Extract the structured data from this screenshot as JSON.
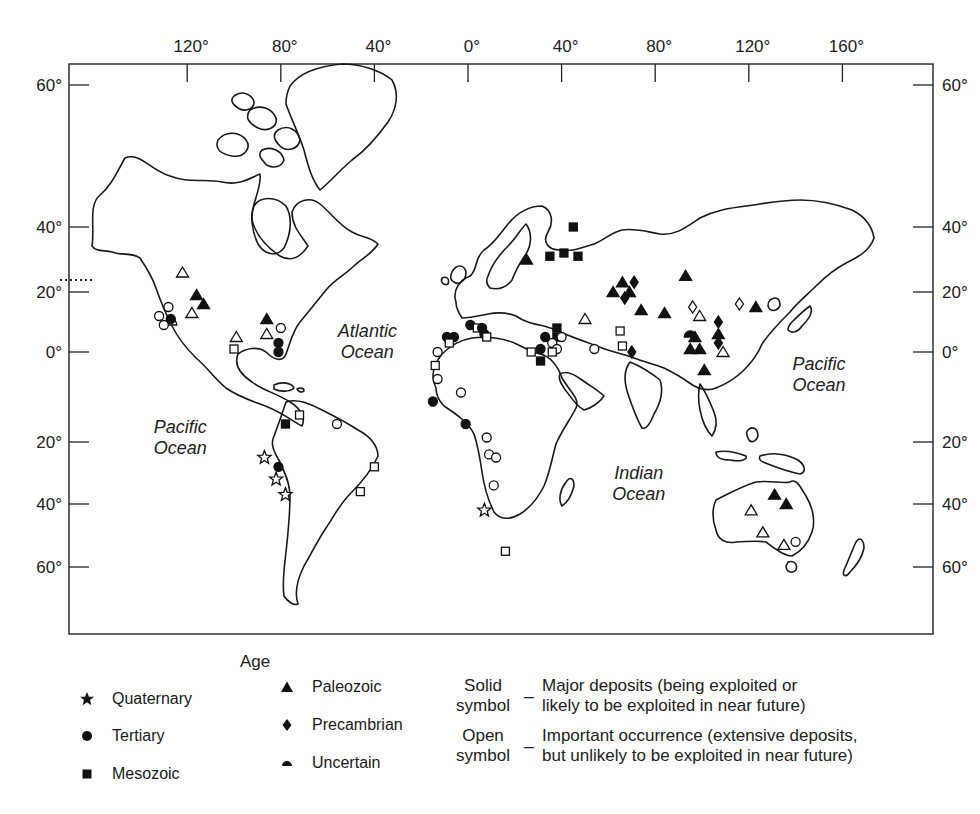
{
  "map": {
    "top_axis_labels": [
      "120°",
      "80°",
      "40°",
      "0°",
      "40°",
      "80°",
      "120°",
      "160°"
    ],
    "top_axis_longitudes": [
      -120,
      -80,
      -40,
      0,
      40,
      80,
      120,
      160
    ],
    "left_axis_labels": [
      "60°",
      "40°",
      "20°",
      "0°",
      "20°",
      "40°",
      "60°"
    ],
    "right_axis_labels": [
      "60°",
      "40°",
      "20°",
      "0°",
      "20°",
      "40°",
      "60°"
    ],
    "axis_latitudes": [
      60,
      40,
      20,
      0,
      -20,
      -40,
      -60
    ],
    "ocean_labels": [
      {
        "id": "pacific-west",
        "lines": [
          "Pacific",
          "Ocean"
        ],
        "lon": -123,
        "lat": -18
      },
      {
        "id": "atlantic",
        "lines": [
          "Atlantic",
          "Ocean"
        ],
        "lon": -43,
        "lat": 5
      },
      {
        "id": "indian",
        "lines": [
          "Indian",
          "Ocean"
        ],
        "lon": 73,
        "lat": -32
      },
      {
        "id": "pacific-east",
        "lines": [
          "Pacific",
          "Ocean"
        ],
        "lon": 150,
        "lat": -4
      }
    ],
    "deposits": [
      {
        "age": "uncertain",
        "solid": false,
        "lon": -127,
        "lat": 10
      },
      {
        "age": "paleozoic",
        "solid": false,
        "lon": -122,
        "lat": 26
      },
      {
        "age": "paleozoic",
        "solid": true,
        "lon": -116,
        "lat": 19
      },
      {
        "age": "paleozoic",
        "solid": true,
        "lon": -113,
        "lat": 16
      },
      {
        "age": "paleozoic",
        "solid": false,
        "lon": -118,
        "lat": 13
      },
      {
        "age": "tertiary",
        "solid": false,
        "lon": -128,
        "lat": 15
      },
      {
        "age": "tertiary",
        "solid": false,
        "lon": -132,
        "lat": 12
      },
      {
        "age": "tertiary",
        "solid": true,
        "lon": -127,
        "lat": 11
      },
      {
        "age": "tertiary",
        "solid": false,
        "lon": -130,
        "lat": 9
      },
      {
        "age": "paleozoic",
        "solid": false,
        "lon": -99,
        "lat": 5
      },
      {
        "age": "paleozoic",
        "solid": false,
        "lon": -86,
        "lat": 6
      },
      {
        "age": "paleozoic",
        "solid": true,
        "lon": -86,
        "lat": 11
      },
      {
        "age": "tertiary",
        "solid": false,
        "lon": -80,
        "lat": 8
      },
      {
        "age": "tertiary",
        "solid": true,
        "lon": -81,
        "lat": 3
      },
      {
        "age": "tertiary",
        "solid": true,
        "lon": -81,
        "lat": 0
      },
      {
        "age": "mesozoic",
        "solid": false,
        "lon": -100,
        "lat": 1
      },
      {
        "age": "mesozoic",
        "solid": true,
        "lon": -78,
        "lat": -16
      },
      {
        "age": "mesozoic",
        "solid": false,
        "lon": -72,
        "lat": -14
      },
      {
        "age": "tertiary",
        "solid": false,
        "lon": -56,
        "lat": -16
      },
      {
        "age": "mesozoic",
        "solid": false,
        "lon": -40,
        "lat": -28
      },
      {
        "age": "mesozoic",
        "solid": false,
        "lon": -46,
        "lat": -36
      },
      {
        "age": "quaternary",
        "solid": false,
        "lon": -87,
        "lat": -25
      },
      {
        "age": "tertiary",
        "solid": true,
        "lon": -81,
        "lat": -28
      },
      {
        "age": "quaternary",
        "solid": false,
        "lon": -82,
        "lat": -32
      },
      {
        "age": "quaternary",
        "solid": false,
        "lon": -78,
        "lat": -37
      },
      {
        "age": "tertiary",
        "solid": true,
        "lon": -9,
        "lat": 5
      },
      {
        "age": "tertiary",
        "solid": true,
        "lon": -6,
        "lat": 5
      },
      {
        "age": "mesozoic",
        "solid": false,
        "lon": -8,
        "lat": 3
      },
      {
        "age": "tertiary",
        "solid": true,
        "lon": 1,
        "lat": 9
      },
      {
        "age": "mesozoic",
        "solid": false,
        "lon": 4,
        "lat": 8
      },
      {
        "age": "tertiary",
        "solid": true,
        "lon": 6,
        "lat": 8
      },
      {
        "age": "tertiary",
        "solid": true,
        "lon": 7,
        "lat": 6
      },
      {
        "age": "mesozoic",
        "solid": false,
        "lon": 8,
        "lat": 5
      },
      {
        "age": "tertiary",
        "solid": false,
        "lon": -13,
        "lat": 0
      },
      {
        "age": "mesozoic",
        "solid": false,
        "lon": -14,
        "lat": -3
      },
      {
        "age": "tertiary",
        "solid": false,
        "lon": -13,
        "lat": -6
      },
      {
        "age": "tertiary",
        "solid": true,
        "lon": -15,
        "lat": -11
      },
      {
        "age": "tertiary",
        "solid": false,
        "lon": -3,
        "lat": -9
      },
      {
        "age": "tertiary",
        "solid": true,
        "lon": -1,
        "lat": -16
      },
      {
        "age": "tertiary",
        "solid": false,
        "lon": 8,
        "lat": -19
      },
      {
        "age": "tertiary",
        "solid": false,
        "lon": 9,
        "lat": -24
      },
      {
        "age": "tertiary",
        "solid": false,
        "lon": 12,
        "lat": -25
      },
      {
        "age": "tertiary",
        "solid": false,
        "lon": 11,
        "lat": -34
      },
      {
        "age": "quaternary",
        "solid": false,
        "lon": 7,
        "lat": -42
      },
      {
        "age": "mesozoic",
        "solid": false,
        "lon": 16,
        "lat": -55
      },
      {
        "age": "paleozoic",
        "solid": true,
        "lon": 25,
        "lat": 30
      },
      {
        "age": "mesozoic",
        "solid": true,
        "lon": 35,
        "lat": 31
      },
      {
        "age": "mesozoic",
        "solid": true,
        "lon": 41,
        "lat": 32
      },
      {
        "age": "mesozoic",
        "solid": true,
        "lon": 45,
        "lat": 40
      },
      {
        "age": "mesozoic",
        "solid": true,
        "lon": 47,
        "lat": 31
      },
      {
        "age": "mesozoic",
        "solid": true,
        "lon": 38,
        "lat": 8
      },
      {
        "age": "mesozoic",
        "solid": true,
        "lon": 38,
        "lat": 5
      },
      {
        "age": "tertiary",
        "solid": true,
        "lon": 33,
        "lat": 5
      },
      {
        "age": "tertiary",
        "solid": true,
        "lon": 31,
        "lat": 1
      },
      {
        "age": "tertiary",
        "solid": false,
        "lon": 36,
        "lat": 3
      },
      {
        "age": "tertiary",
        "solid": false,
        "lon": 40,
        "lat": 5
      },
      {
        "age": "tertiary",
        "solid": false,
        "lon": 38,
        "lat": 1
      },
      {
        "age": "mesozoic",
        "solid": false,
        "lon": 27,
        "lat": 0
      },
      {
        "age": "mesozoic",
        "solid": false,
        "lon": 36,
        "lat": 0
      },
      {
        "age": "mesozoic",
        "solid": true,
        "lon": 31,
        "lat": -2
      },
      {
        "age": "tertiary",
        "solid": false,
        "lon": 54,
        "lat": 1
      },
      {
        "age": "paleozoic",
        "solid": false,
        "lon": 50,
        "lat": 11
      },
      {
        "age": "mesozoic",
        "solid": false,
        "lon": 65,
        "lat": 7
      },
      {
        "age": "mesozoic",
        "solid": false,
        "lon": 66,
        "lat": 2
      },
      {
        "age": "precambrian",
        "solid": true,
        "lon": 70,
        "lat": 0
      },
      {
        "age": "paleozoic",
        "solid": true,
        "lon": 69,
        "lat": 20
      },
      {
        "age": "paleozoic",
        "solid": true,
        "lon": 62,
        "lat": 20
      },
      {
        "age": "precambrian",
        "solid": true,
        "lon": 67,
        "lat": 18
      },
      {
        "age": "precambrian",
        "solid": true,
        "lon": 71,
        "lat": 23
      },
      {
        "age": "paleozoic",
        "solid": true,
        "lon": 66,
        "lat": 23
      },
      {
        "age": "paleozoic",
        "solid": true,
        "lon": 74,
        "lat": 14
      },
      {
        "age": "paleozoic",
        "solid": true,
        "lon": 84,
        "lat": 13
      },
      {
        "age": "paleozoic",
        "solid": true,
        "lon": 93,
        "lat": 25
      },
      {
        "age": "precambrian",
        "solid": false,
        "lon": 96,
        "lat": 15
      },
      {
        "age": "paleozoic",
        "solid": false,
        "lon": 99,
        "lat": 12
      },
      {
        "age": "uncertain",
        "solid": true,
        "lon": 95,
        "lat": 6
      },
      {
        "age": "paleozoic",
        "solid": true,
        "lon": 97,
        "lat": 5
      },
      {
        "age": "paleozoic",
        "solid": true,
        "lon": 95,
        "lat": 1
      },
      {
        "age": "paleozoic",
        "solid": true,
        "lon": 99,
        "lat": 1
      },
      {
        "age": "paleozoic",
        "solid": true,
        "lon": 101,
        "lat": -4
      },
      {
        "age": "precambrian",
        "solid": true,
        "lon": 107,
        "lat": 10
      },
      {
        "age": "paleozoic",
        "solid": true,
        "lon": 107,
        "lat": 6
      },
      {
        "age": "precambrian",
        "solid": true,
        "lon": 107,
        "lat": 3
      },
      {
        "age": "paleozoic",
        "solid": false,
        "lon": 109,
        "lat": 0
      },
      {
        "age": "precambrian",
        "solid": false,
        "lon": 116,
        "lat": 16
      },
      {
        "age": "paleozoic",
        "solid": true,
        "lon": 123,
        "lat": 15
      },
      {
        "age": "paleozoic",
        "solid": true,
        "lon": 131,
        "lat": -37
      },
      {
        "age": "paleozoic",
        "solid": true,
        "lon": 136,
        "lat": -40
      },
      {
        "age": "paleozoic",
        "solid": false,
        "lon": 121,
        "lat": -42
      },
      {
        "age": "paleozoic",
        "solid": false,
        "lon": 126,
        "lat": -49
      },
      {
        "age": "paleozoic",
        "solid": false,
        "lon": 135,
        "lat": -53
      },
      {
        "age": "tertiary",
        "solid": false,
        "lon": 140,
        "lat": -52
      }
    ]
  },
  "legend": {
    "age_title": "Age",
    "ages": [
      {
        "id": "quaternary",
        "label": "Quaternary",
        "icon": "star-icon"
      },
      {
        "id": "tertiary",
        "label": "Tertiary",
        "icon": "circle-icon"
      },
      {
        "id": "mesozoic",
        "label": "Mesozoic",
        "icon": "square-icon"
      },
      {
        "id": "paleozoic",
        "label": "Paleozoic",
        "icon": "triangle-icon"
      },
      {
        "id": "precambrian",
        "label": "Precambrian",
        "icon": "diamond-icon"
      },
      {
        "id": "uncertain",
        "label": "Uncertain",
        "icon": "half-circle-icon"
      }
    ],
    "symbol_types": [
      {
        "key_lines": [
          "Solid",
          "symbol"
        ],
        "dash": "_",
        "desc_lines": [
          "Major deposits (being exploited or",
          "likely to be exploited in near future)"
        ]
      },
      {
        "key_lines": [
          "Open",
          "symbol"
        ],
        "dash": "_",
        "desc_lines": [
          "Important occurrence (extensive deposits,",
          "but unlikely to be exploited in near future)"
        ]
      }
    ]
  }
}
